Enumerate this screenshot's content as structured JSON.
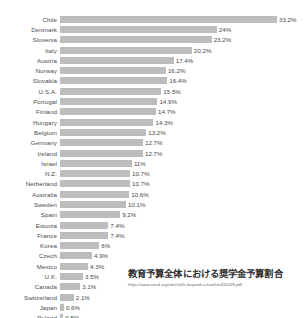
{
  "caption": {
    "title": "教育予算全体における奨学金予算割合",
    "url": "https://www.oecd.org/edu/skills-beyond-school/skill31028.pdf"
  },
  "style": {
    "bar_color": "#bdbdbd",
    "text_color": "#4a4a4a",
    "background": "#ffffff"
  },
  "chart_data": {
    "type": "bar",
    "orientation": "horizontal",
    "title": "教育予算全体における奨学金予算割合",
    "xlabel": "",
    "ylabel": "",
    "xlim": [
      0,
      33.2
    ],
    "grid": false,
    "legend": false,
    "value_suffix": "%",
    "categories": [
      "Chile",
      "Denmark",
      "Slovenia",
      "Italy",
      "Austria",
      "Norway",
      "Slovakia",
      "U.S.A.",
      "Portugal",
      "Finland",
      "Hungary",
      "Belgium",
      "Germany",
      "Ireland",
      "Israel",
      "N.Z.",
      "Netherland",
      "Australia",
      "Sweden",
      "Spain",
      "Estonia",
      "France",
      "Korea",
      "Czech",
      "Mexico",
      "U.K.",
      "Canada",
      "Switzerland",
      "Japan",
      "Poland"
    ],
    "values": [
      33.2,
      24,
      23.2,
      20.2,
      17.4,
      16.2,
      16.4,
      15.5,
      14.9,
      14.7,
      14.3,
      13.2,
      12.7,
      12.7,
      11,
      10.7,
      10.7,
      10.6,
      10.1,
      9.2,
      7.4,
      7.4,
      6,
      4.9,
      4.3,
      3.5,
      3.1,
      2.1,
      0.6,
      0.5
    ],
    "value_labels": [
      "33.2%",
      "24%",
      "23.2%",
      "20.2%",
      "17.4%",
      "16.2%",
      "16.4%",
      "15.5%",
      "14.9%",
      "14.7%",
      "14.3%",
      "13.2%",
      "12.7%",
      "12.7%",
      "11%",
      "10.7%",
      "10.7%",
      "10.6%",
      "10.1%",
      "9.2%",
      "7.4%",
      "7.4%",
      "6%",
      "4.9%",
      "4.3%",
      "3.5%",
      "3.1%",
      "2.1%",
      "0.6%",
      "0.5%"
    ]
  }
}
